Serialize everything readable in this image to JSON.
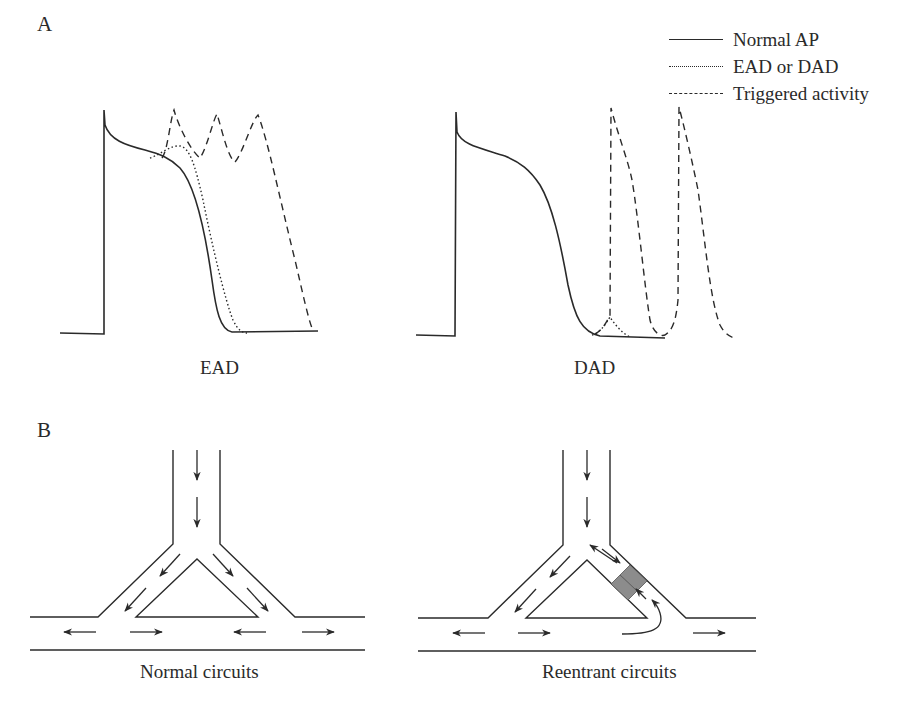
{
  "panels": {
    "A": {
      "label": "A",
      "left_caption": "EAD",
      "right_caption": "DAD"
    },
    "B": {
      "label": "B",
      "left_caption": "Normal  circuits",
      "right_caption": "Reentrant circuits"
    }
  },
  "legend": {
    "items": [
      {
        "label": "Normal  AP",
        "style": "solid"
      },
      {
        "label": "EAD or  DAD",
        "style": "dotted"
      },
      {
        "label": "Triggered activity",
        "style": "dashed"
      }
    ]
  },
  "colors": {
    "line": "#2a2a2a",
    "block": "#8c8c8c",
    "background": "#ffffff"
  }
}
